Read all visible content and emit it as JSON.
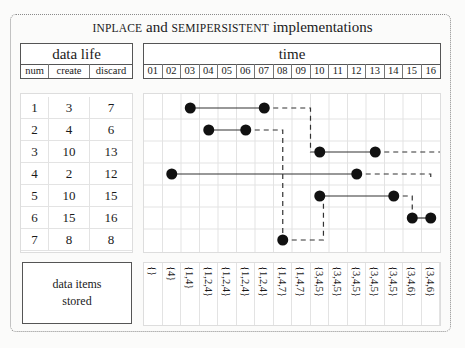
{
  "title": {
    "part1": "INPLACE",
    "part2": " and ",
    "part3": "SEMIPERSISTENT",
    "part4": " implementations"
  },
  "data_life": {
    "header": "data life",
    "columns": [
      "num",
      "create",
      "discard"
    ],
    "rows": [
      {
        "num": "1",
        "create": "3",
        "discard": "7"
      },
      {
        "num": "2",
        "create": "4",
        "discard": "6"
      },
      {
        "num": "3",
        "create": "10",
        "discard": "13"
      },
      {
        "num": "4",
        "create": "2",
        "discard": "12"
      },
      {
        "num": "5",
        "create": "10",
        "discard": "15"
      },
      {
        "num": "6",
        "create": "15",
        "discard": "16"
      },
      {
        "num": "7",
        "create": "8",
        "discard": "8"
      }
    ]
  },
  "time": {
    "header": "time",
    "ticks": [
      "01",
      "02",
      "03",
      "04",
      "05",
      "06",
      "07",
      "08",
      "09",
      "10",
      "11",
      "12",
      "13",
      "14",
      "15",
      "16"
    ]
  },
  "stored": {
    "label_line1": "data items",
    "label_line2": "stored",
    "values": [
      "{}",
      "{4}",
      "{1,4}",
      "{1,2,4}",
      "{1,2,4}",
      "{1,2,4}",
      "{1,2,4}",
      "{1,4,7}",
      "{1,4,7}",
      "{3,4,5}",
      "{3,4,5}",
      "{3,4,5}",
      "{3,4,5}",
      "{3,4,5}",
      "{3,4,6}",
      "{3,4,6}"
    ]
  },
  "lifetimes": [
    {
      "num": 1,
      "start": 3,
      "end": 7
    },
    {
      "num": 2,
      "start": 4,
      "end": 6
    },
    {
      "num": 3,
      "start": 10,
      "end": 13
    },
    {
      "num": 4,
      "start": 2,
      "end": 12
    },
    {
      "num": 5,
      "start": 10,
      "end": 14
    },
    {
      "num": 6,
      "start": 15,
      "end": 16
    },
    {
      "num": 7,
      "start": 8,
      "end": 8
    }
  ],
  "colors": {
    "dot": "#111111",
    "line": "#333333",
    "grid": "#e3e3e3",
    "border": "#555555"
  }
}
